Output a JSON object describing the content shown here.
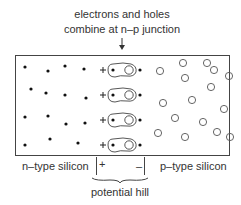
{
  "caption": {
    "line1": "electrons and holes",
    "line2": "combine at n–p junction"
  },
  "labels": {
    "n_region": "n–type silicon",
    "p_region": "p–type silicon",
    "potential_hill": "potential hill",
    "plus": "+",
    "minus": "–"
  },
  "junction_pairs": [
    {
      "y": 70
    },
    {
      "y": 95
    },
    {
      "y": 120
    },
    {
      "y": 145
    }
  ],
  "electrons_n_side": [
    [
      25,
      67
    ],
    [
      48,
      71
    ],
    [
      65,
      66
    ],
    [
      84,
      69
    ],
    [
      31,
      89
    ],
    [
      46,
      93
    ],
    [
      65,
      95
    ],
    [
      86,
      98
    ],
    [
      25,
      117
    ],
    [
      48,
      116
    ],
    [
      66,
      124
    ],
    [
      85,
      123
    ],
    [
      25,
      145
    ],
    [
      50,
      139
    ],
    [
      78,
      143
    ]
  ],
  "holes_p_side": [
    [
      160,
      71
    ],
    [
      183,
      63
    ],
    [
      207,
      63
    ],
    [
      185,
      78
    ],
    [
      214,
      70
    ],
    [
      229,
      76
    ],
    [
      163,
      103
    ],
    [
      192,
      100
    ],
    [
      211,
      87
    ],
    [
      224,
      109
    ],
    [
      175,
      118
    ],
    [
      203,
      122
    ],
    [
      185,
      137
    ],
    [
      217,
      132
    ],
    [
      230,
      137
    ],
    [
      158,
      133
    ]
  ]
}
